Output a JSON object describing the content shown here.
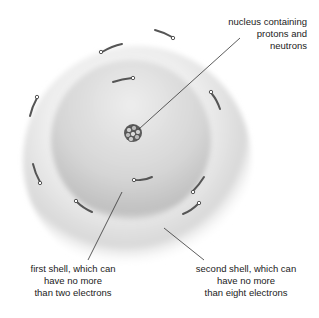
{
  "diagram": {
    "labels": {
      "nucleus": {
        "lines": [
          "nucleus containing",
          "protons and",
          "neutrons"
        ]
      },
      "first_shell": {
        "lines": [
          "first shell, which can",
          "have no more",
          "than two electrons"
        ]
      },
      "second_shell": {
        "lines": [
          "second shell, which can",
          "have no more",
          "than eight electrons"
        ]
      }
    },
    "components": {
      "nucleus": "nucleus",
      "first_shell_electrons": 2,
      "second_shell_electrons": 8
    },
    "colors": {
      "outer_shell": "#e6e6e6",
      "inner_shell": "#cfcfcf",
      "nucleus": "#555555",
      "electron": "#444444",
      "leader_line": "#333333"
    }
  }
}
